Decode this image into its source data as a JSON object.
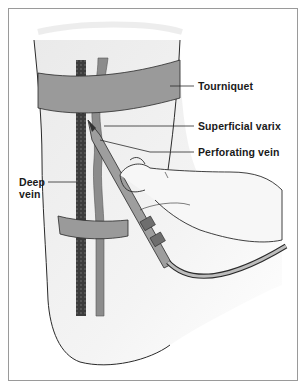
{
  "figure": {
    "labels": {
      "tourniquet": "Tourniquet",
      "superficial_varix": "Superficial varix",
      "perforating_vein": "Perforating vein",
      "deep_vein_line1": "Deep",
      "deep_vein_line2": "vein"
    },
    "colors": {
      "tourniquet": "#9a9a9a",
      "deep_vein": "#3a3a3a",
      "superficial_vein": "#8c8c8c",
      "skin": "#f2f2f2",
      "outline": "#2a2a2a",
      "frame": "#9a9a9a"
    }
  }
}
